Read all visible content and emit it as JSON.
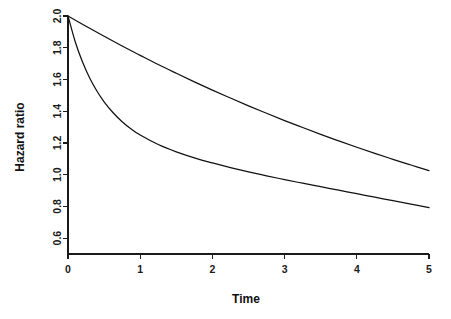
{
  "chart_data": {
    "type": "line",
    "title": "",
    "subtitle": "",
    "xlabel": "Time",
    "ylabel": "Hazard ratio",
    "xlim": [
      0,
      5
    ],
    "ylim": [
      0.5,
      2.0
    ],
    "xticks": [
      0,
      1,
      2,
      3,
      4,
      5
    ],
    "xtick_labels": [
      "0",
      "1",
      "2",
      "3",
      "4",
      "5"
    ],
    "yticks": [
      0.6,
      0.8,
      1.0,
      1.2,
      1.4,
      1.6,
      1.8,
      2.0
    ],
    "ytick_labels": [
      "0.6",
      "0.8",
      "1.0",
      "1.2",
      "1.4",
      "1.6",
      "1.8",
      "2.0"
    ],
    "grid": false,
    "legend": false,
    "legend_position": "none",
    "line_color": "#111111",
    "background_color": "#ffffff",
    "axis_color": "#1a1a1a",
    "series": [
      {
        "name": "slow-decay",
        "color": "#111111",
        "x": [
          0,
          0.25,
          0.5,
          0.75,
          1,
          1.25,
          1.5,
          1.75,
          2,
          2.25,
          2.5,
          2.75,
          3,
          3.25,
          3.5,
          3.75,
          4,
          4.25,
          4.5,
          4.75,
          5
        ],
        "y": [
          2.0,
          1.935,
          1.872,
          1.811,
          1.752,
          1.694,
          1.639,
          1.585,
          1.533,
          1.483,
          1.434,
          1.387,
          1.341,
          1.297,
          1.254,
          1.213,
          1.173,
          1.134,
          1.097,
          1.061,
          1.026
        ]
      },
      {
        "name": "fast-decay",
        "color": "#111111",
        "x": [
          0,
          0.1,
          0.2,
          0.3,
          0.4,
          0.5,
          0.625,
          0.75,
          0.875,
          1,
          1.25,
          1.5,
          1.75,
          2,
          2.25,
          2.5,
          2.75,
          3,
          3.25,
          3.5,
          3.75,
          4,
          4.25,
          4.5,
          4.75,
          5
        ],
        "y": [
          2.0,
          1.838,
          1.711,
          1.609,
          1.527,
          1.459,
          1.39,
          1.334,
          1.288,
          1.25,
          1.19,
          1.144,
          1.106,
          1.074,
          1.045,
          1.018,
          0.993,
          0.969,
          0.946,
          0.924,
          0.902,
          0.88,
          0.858,
          0.836,
          0.814,
          0.792
        ]
      }
    ]
  },
  "plot_geometry": {
    "x_axis_left_px": 68,
    "x_axis_right_px": 429,
    "y_axis_top_px": 16,
    "y_axis_bottom_px": 254,
    "y_value_top": 2.0,
    "y_value_bottom": 0.5
  }
}
